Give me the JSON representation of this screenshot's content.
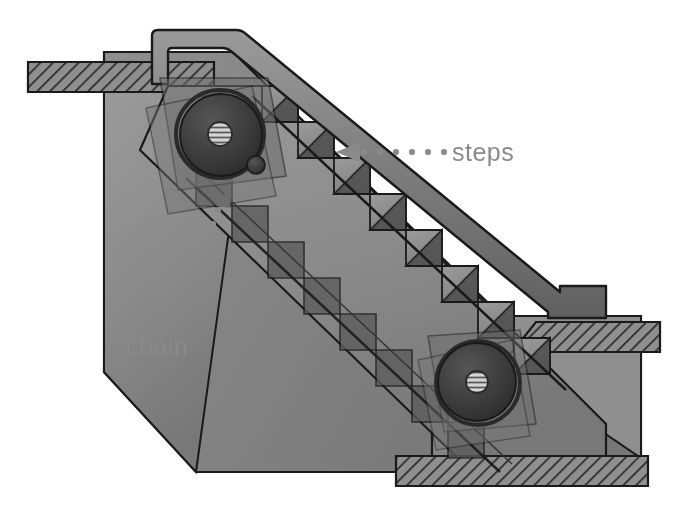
{
  "figure": {
    "background_color": "#ffffff",
    "width": 677,
    "height": 517
  },
  "labels": [
    {
      "id": "steps",
      "text": "steps",
      "text_color": "#8a8a8a",
      "text_x": 452,
      "text_y": 160,
      "leader": "dotted",
      "arrow": "left-pointing-triangle",
      "arrow_x": 338,
      "arrow_y": 152
    },
    {
      "id": "chain",
      "text": "chain",
      "text_color": "#8a8a8a",
      "text_x": 126,
      "text_y": 354,
      "leader": "dotted-curved",
      "arrow": "up-right-pointing-triangle",
      "arrow_x": 224,
      "arrow_y": 196
    }
  ],
  "colors": {
    "outline": "#1a1a1a",
    "hatch_fill": "#8f8f8f",
    "hatch_line": "#2b2b2b",
    "truss_body": "#8a8a8a",
    "truss_body_dark": "#6f6f6f",
    "handrail": "#7e7e7e",
    "handrail_dark": "#4a4a4a",
    "step_tread": "#909090",
    "step_riser": "#4e4e4e",
    "return_step": "#5a5a5a",
    "wheel_disc": "#3b3b3b",
    "wheel_hub": "#c9c9c9",
    "wheel_rim": "#2a2a2a",
    "label_gray": "#8a8a8a",
    "floor_slab": "#8c8c8c",
    "pit_wall": "#7a7a7a",
    "pit_wall_light": "#949494"
  },
  "parts": {
    "upper_floor_slab": "hatched-floor-slab-top-left",
    "lower_floor_slab": "hatched-floor-slab-bottom-right",
    "landing_step_slab": "hatched-landing-step-right",
    "upper_sprocket": "drive-sprocket-wheel-upper",
    "lower_sprocket": "return-sprocket-wheel-lower",
    "idler": "small-idler-roller",
    "handrail": "handrail-loop",
    "truss": "inclined-truss-body",
    "upper_step_band": "upper-step-run",
    "return_step_band": "lower-return-step-run"
  },
  "counts": {
    "upper_steps": 9,
    "return_steps": 9,
    "sprockets": 2
  }
}
